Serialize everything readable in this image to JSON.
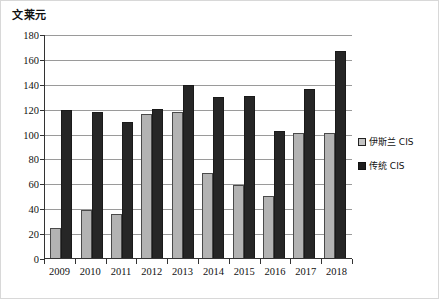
{
  "chart_data": {
    "type": "bar",
    "title": "",
    "ylabel": "文莱元",
    "xlabel": "",
    "categories": [
      "2009",
      "2010",
      "2011",
      "2012",
      "2013",
      "2014",
      "2015",
      "2016",
      "2017",
      "2018"
    ],
    "series": [
      {
        "name": "伊斯兰 CIS",
        "color": "#b3b3b3",
        "values": [
          25,
          39.5,
          36.5,
          116.5,
          118,
          69.5,
          59.5,
          51,
          101.5,
          101
        ]
      },
      {
        "name": "传统 CIS",
        "color": "#262626",
        "values": [
          120,
          118,
          110,
          120.5,
          140,
          130,
          131,
          102.5,
          136.5,
          167
        ]
      }
    ],
    "ylim": [
      0,
      180
    ],
    "yticks": [
      0,
      20,
      40,
      60,
      80,
      100,
      120,
      140,
      160,
      180
    ],
    "ytick_labels": [
      "0",
      "20",
      "40",
      "60",
      "80",
      "100",
      "120",
      "140",
      "160",
      "180"
    ],
    "grid": true,
    "legend_position": "right"
  },
  "legend": {
    "items": [
      {
        "label": "伊斯兰 CIS",
        "swatch": "islamic"
      },
      {
        "label": "传统 CIS",
        "swatch": "traditional"
      }
    ]
  }
}
